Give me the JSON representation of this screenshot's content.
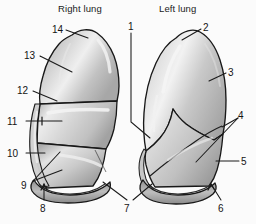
{
  "figure": {
    "kind": "anatomical-diagram",
    "titles": [
      {
        "id": "right-lung-title",
        "text": "Right lung",
        "x": 58,
        "y": 3
      },
      {
        "id": "left-lung-title",
        "text": "Left lung",
        "x": 159,
        "y": 3
      }
    ],
    "callouts": [
      {
        "id": "1",
        "text": "1",
        "x": 128,
        "y": 21
      },
      {
        "id": "2",
        "text": "2",
        "x": 203,
        "y": 22
      },
      {
        "id": "3",
        "text": "3",
        "x": 228,
        "y": 67
      },
      {
        "id": "4",
        "text": "4",
        "x": 238,
        "y": 110
      },
      {
        "id": "5",
        "text": "5",
        "x": 241,
        "y": 156
      },
      {
        "id": "6",
        "text": "6",
        "x": 218,
        "y": 203
      },
      {
        "id": "7",
        "text": "7",
        "x": 124,
        "y": 203
      },
      {
        "id": "8",
        "text": "8",
        "x": 40,
        "y": 203
      },
      {
        "id": "9",
        "text": "9",
        "x": 21,
        "y": 180
      },
      {
        "id": "10",
        "text": "10",
        "x": 7,
        "y": 148
      },
      {
        "id": "11",
        "text": "11",
        "x": 7,
        "y": 116
      },
      {
        "id": "12",
        "text": "12",
        "x": 17,
        "y": 85
      },
      {
        "id": "13",
        "text": "13",
        "x": 24,
        "y": 50
      },
      {
        "id": "14",
        "text": "14",
        "x": 52,
        "y": 24
      }
    ],
    "colors": {
      "background": "#fbfbfb",
      "outline": "#181818",
      "fill_light": "#e7e7e7",
      "fill_mid": "#c6c6c6",
      "fill_dark": "#9a9a9a",
      "highlight": "#f4f4f4",
      "leader_line": "#1a1a1a",
      "text": "#141414"
    }
  }
}
